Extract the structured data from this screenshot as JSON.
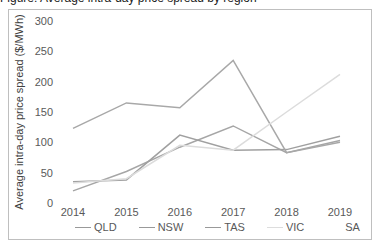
{
  "caption_partial": "Figure: Average intra-day price spread by region",
  "chart_data": {
    "type": "line",
    "title": "",
    "xlabel": "",
    "ylabel": "Average intra-day price spread ($/MWh)",
    "ylim": [
      0,
      300
    ],
    "yticks": [
      0,
      50,
      100,
      150,
      200,
      250,
      300
    ],
    "grid": false,
    "legend_position": "bottom",
    "categories": [
      "2014",
      "2015",
      "2016",
      "2017",
      "2018",
      "2019"
    ],
    "series": [
      {
        "name": "QLD",
        "color": "#a6a6a6",
        "values": [
          20,
          52,
          92,
          127,
          83,
          103
        ]
      },
      {
        "name": "NSW",
        "color": "#a0a0a0",
        "values": [
          35,
          38,
          112,
          87,
          88,
          110
        ]
      },
      {
        "name": "TAS",
        "color": "#a8a8a8",
        "values": [
          123,
          165,
          157,
          235,
          83,
          100
        ]
      },
      {
        "name": "VIC",
        "color": "#dcdcdc",
        "values": [
          33,
          40,
          95,
          87,
          150,
          212
        ]
      },
      {
        "name": "SA",
        "color": "#ffffff",
        "values": [
          null,
          null,
          null,
          null,
          null,
          null
        ]
      }
    ]
  },
  "legend": [
    {
      "label": "QLD",
      "color": "#999999"
    },
    {
      "label": "NSW",
      "color": "#999999"
    },
    {
      "label": "TAS",
      "color": "#999999"
    },
    {
      "label": "VIC",
      "color": "#dddddd"
    },
    {
      "label": "SA",
      "color": "#ffffff"
    }
  ]
}
